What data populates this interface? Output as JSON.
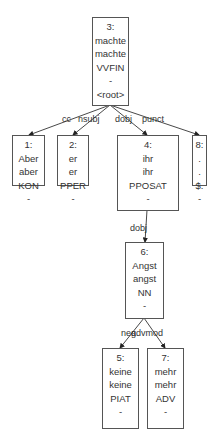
{
  "diagram": {
    "type": "dependency-tree",
    "nodes": [
      {
        "id": "3",
        "index": "3:",
        "form": "machte",
        "lemma": "machte",
        "pos": "VVFIN",
        "feats": "-",
        "head": "<root>"
      },
      {
        "id": "1",
        "index": "1:",
        "form": "Aber",
        "lemma": "aber",
        "pos": "KON",
        "feats": "-"
      },
      {
        "id": "2",
        "index": "2:",
        "form": "er",
        "lemma": "er",
        "pos": "PPER",
        "feats": "-"
      },
      {
        "id": "4",
        "index": "4:",
        "form": "ihr",
        "lemma": "ihr",
        "pos": "PPOSAT",
        "feats": "-"
      },
      {
        "id": "8",
        "index": "8:",
        "form": ".",
        "lemma": ".",
        "pos": "$.",
        "feats": "-"
      },
      {
        "id": "6",
        "index": "6:",
        "form": "Angst",
        "lemma": "angst",
        "pos": "NN",
        "feats": "-"
      },
      {
        "id": "5",
        "index": "5:",
        "form": "keine",
        "lemma": "keine",
        "pos": "PIAT",
        "feats": "-"
      },
      {
        "id": "7",
        "index": "7:",
        "form": "mehr",
        "lemma": "mehr",
        "pos": "ADV",
        "feats": "-"
      }
    ],
    "edges": [
      {
        "from": "3",
        "to": "1",
        "label": "cc"
      },
      {
        "from": "3",
        "to": "2",
        "label": "nsubj"
      },
      {
        "from": "3",
        "to": "4",
        "label": "dobj"
      },
      {
        "from": "3",
        "to": "8",
        "label": "punct"
      },
      {
        "from": "4",
        "to": "6",
        "label": "dobj"
      },
      {
        "from": "6",
        "to": "5",
        "label": "neg"
      },
      {
        "from": "6",
        "to": "7",
        "label": "advmod"
      }
    ],
    "colors": {
      "line": "#333333",
      "border": "#555555",
      "text": "#333333",
      "background": "#ffffff"
    }
  }
}
